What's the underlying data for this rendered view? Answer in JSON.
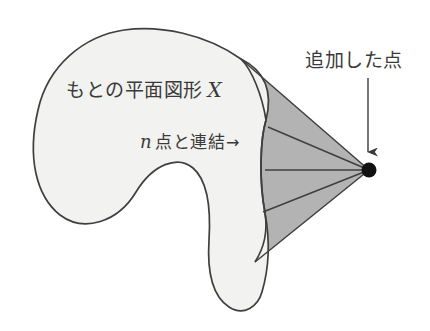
{
  "figure": {
    "background_color": "#ffffff",
    "shape_fill_color": "#f2f2f0",
    "cone_fill_color": "#b3b3b3",
    "outline_color": "#3f3f3f",
    "point_color": "#111111",
    "text_color": "#3a3a3a"
  },
  "labels": {
    "shape": {
      "text": "もとの平面図形",
      "symbol": "X",
      "name": "original-plane-figure-label"
    },
    "connect": {
      "symbol": "n",
      "text": "点と連結",
      "arrow": "→",
      "name": "connect-n-points-label"
    },
    "added_point": {
      "text": "追加した点",
      "name": "added-point-label"
    }
  },
  "annotations": {
    "pointer_arrow": {
      "name": "down-arrow-annotation",
      "from_x": 368,
      "from_y": 78,
      "to_x": 368,
      "to_y": 163
    },
    "apex_point": {
      "name": "added-vertex-dot",
      "cx": 369,
      "cy": 170,
      "r": 7
    },
    "connector_lines_count": 5
  },
  "geometry": {
    "blob_path": "M 241 59 C 206 34 160 25 124 30 C 84 36 48 65 38 110 C 27 157 36 196 60 215 C 84 233 118 222 136 192 C 153 164 178 155 193 168 C 207 180 211 208 209 240 C 207 272 212 296 229 307 C 244 317 258 306 262 292 C 269 268 270 240 265 213 C 259 181 260 140 266 120 C 271 100 271 74 241 59 Z",
    "cone_outer_top": "M 241 59 L 369 170",
    "cone_outer_bottom": "M 255 262 L 369 170",
    "connector_endpoints": [
      {
        "x": 241,
        "y": 59
      },
      {
        "x": 268,
        "y": 127
      },
      {
        "x": 265,
        "y": 170
      },
      {
        "x": 263,
        "y": 212
      },
      {
        "x": 255,
        "y": 262
      }
    ]
  }
}
